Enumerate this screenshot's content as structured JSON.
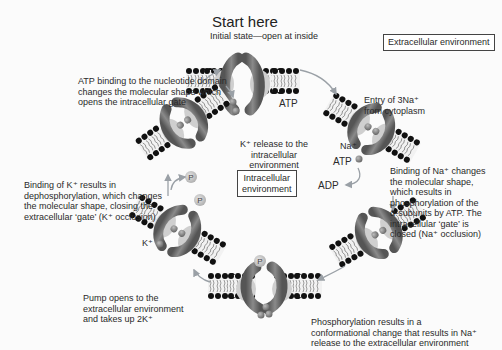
{
  "title": "Start here",
  "subtitle": "Initial state—open at inside",
  "regions": {
    "extracellular": "Extracellular environment",
    "intracellular_line1": "Intracellular",
    "intracellular_line2": "environment"
  },
  "steps": [
    {
      "id": "atp-binding",
      "lines": [
        "ATP binding to the nucleotide domain",
        "changes the molecular shape which",
        "opens the intracellular gate"
      ]
    },
    {
      "id": "na-entry",
      "lines": [
        "Entry of 3Na⁺",
        "from cytoplasm"
      ]
    },
    {
      "id": "na-binding",
      "lines": [
        "Binding of Na⁺ changes",
        "the molecular shape,",
        "which results in",
        "phosphorylation of the",
        "α-subunits by ATP. The",
        "intracellular ‘gate’ is",
        "closed (Na⁺ occlusion)"
      ]
    },
    {
      "id": "phosphorylation",
      "lines": [
        "Phosphorylation results in a",
        "conformational change that results in Na⁺",
        "release to the extracellular environment"
      ]
    },
    {
      "id": "pump-opens",
      "lines": [
        "Pump opens to the",
        "extracellular environment",
        "and takes up 2K⁺"
      ]
    },
    {
      "id": "k-binding",
      "lines": [
        "Binding of K⁺ results in",
        "dephosphorylation, which changes",
        "the molecular shape, closing the",
        "extracellular ‘gate’ (K⁺ occlusion)"
      ]
    },
    {
      "id": "k-release",
      "lines": [
        "K⁺ release to the",
        "intracellular",
        "environment"
      ]
    }
  ],
  "labels": {
    "atp_top": "ATP",
    "atp_right": "ATP",
    "adp": "ADP",
    "na_ion": "Na⁺",
    "k_ion": "K⁺",
    "phosphate": "P"
  },
  "colors": {
    "protein": "#6e6e6e",
    "protein_light": "#bdbdbd",
    "lipid_head": "#1a1a1a",
    "ion": "#8a8a8a",
    "phosphate": "#c8c8c8",
    "arrow": "#9aa0a6"
  }
}
